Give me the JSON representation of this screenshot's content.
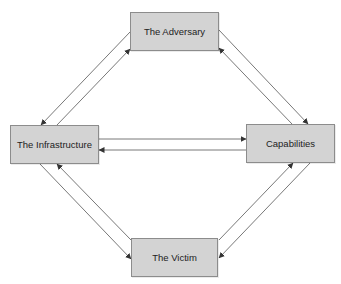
{
  "diagram": {
    "type": "diamond-model",
    "colors": {
      "node_fill": "#d3d3d3",
      "node_border": "#8c8c8c",
      "text": "#222222",
      "edge": "#555555"
    },
    "nodes": {
      "adversary": {
        "label": "The Adversary",
        "x": 130,
        "y": 12,
        "w": 89,
        "h": 39
      },
      "infrastructure": {
        "label": "The Infrastructure",
        "x": 10,
        "y": 125,
        "w": 89,
        "h": 39
      },
      "capabilities": {
        "label": "Capabilities",
        "x": 246,
        "y": 124,
        "w": 89,
        "h": 39
      },
      "victim": {
        "label": "The Victim",
        "x": 131,
        "y": 238,
        "w": 87,
        "h": 39
      }
    },
    "edges": [
      {
        "from": "adversary",
        "to": "infrastructure"
      },
      {
        "from": "infrastructure",
        "to": "adversary"
      },
      {
        "from": "adversary",
        "to": "capabilities"
      },
      {
        "from": "capabilities",
        "to": "adversary"
      },
      {
        "from": "infrastructure",
        "to": "capabilities"
      },
      {
        "from": "capabilities",
        "to": "infrastructure"
      },
      {
        "from": "infrastructure",
        "to": "victim"
      },
      {
        "from": "victim",
        "to": "infrastructure"
      },
      {
        "from": "victim",
        "to": "capabilities"
      },
      {
        "from": "capabilities",
        "to": "victim"
      }
    ]
  }
}
